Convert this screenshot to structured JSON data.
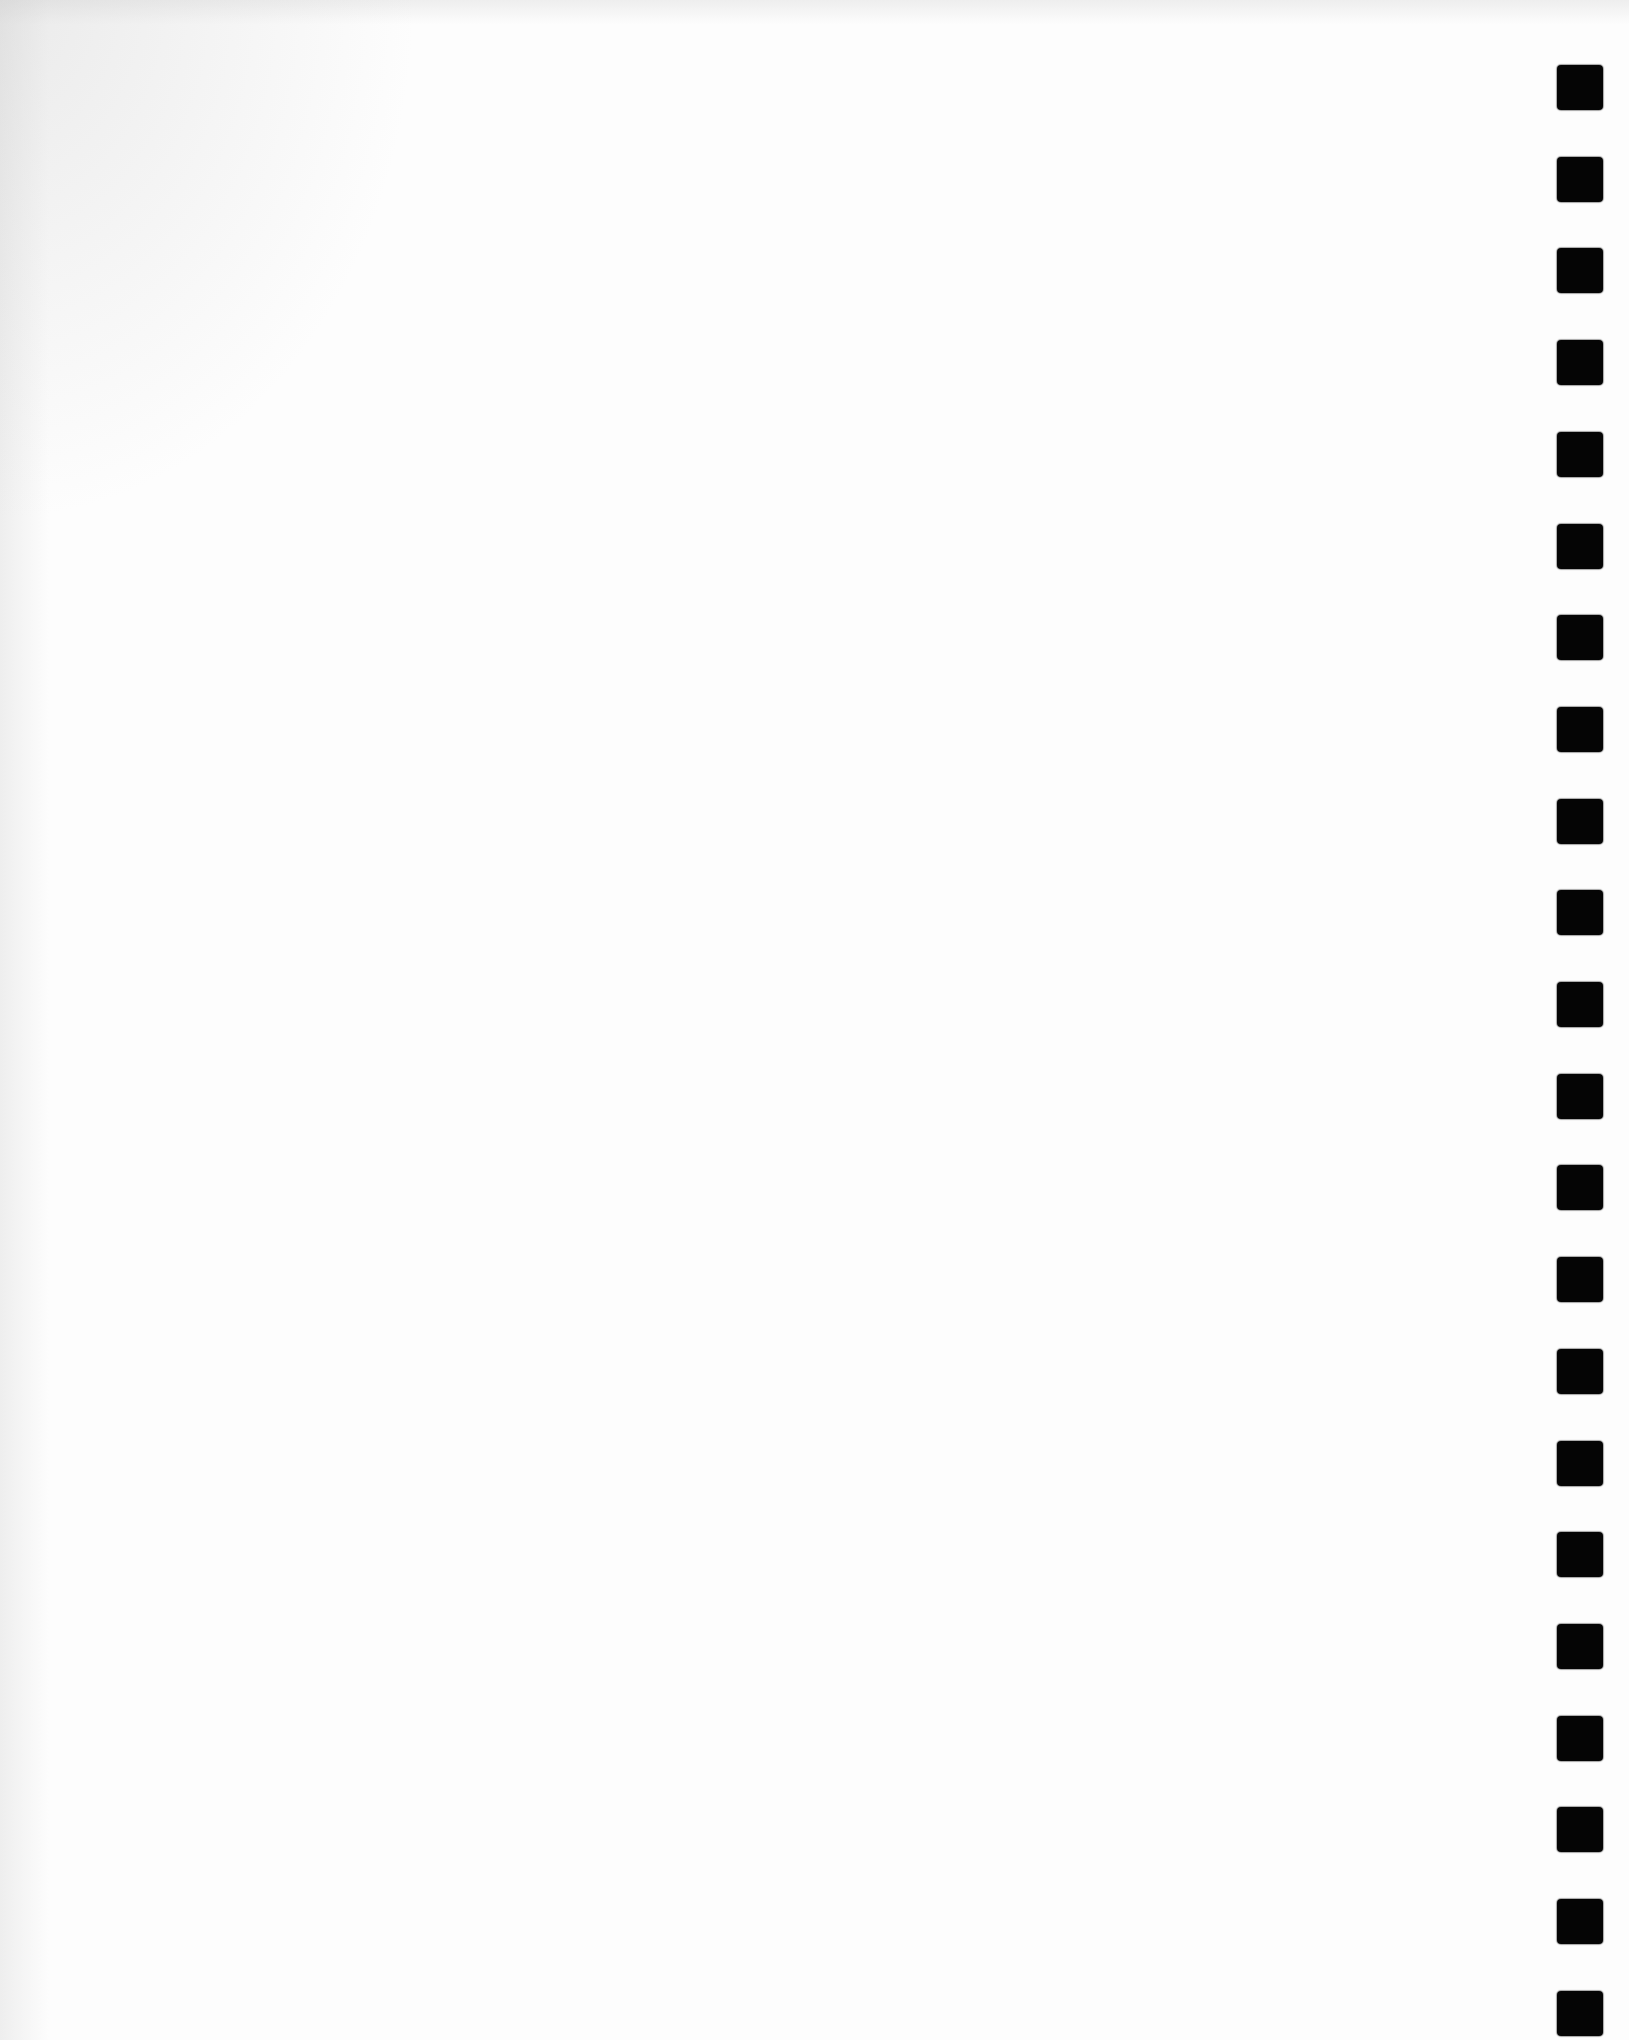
{
  "page": {
    "type": "scanned blank sheet with binding/punch marks",
    "background_color": "#fdfdfd",
    "content_text": ""
  },
  "binding_marks": {
    "count": 22,
    "color": "#050505",
    "side": "right",
    "first_top_px": 65,
    "pitch_px": 91.7,
    "size_px": [
      46,
      45
    ]
  }
}
